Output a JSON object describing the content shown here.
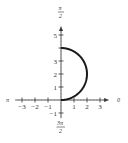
{
  "chart_data": {
    "type": "line",
    "coordinate_system": "polar",
    "title": "",
    "curve": {
      "name": "r = 4 sin θ",
      "theta_range": [
        0,
        1.5708
      ],
      "color": "#1a1a1a",
      "points_cartesian": [
        {
          "x": 0,
          "y": 0
        },
        {
          "x": 2,
          "y": 2
        },
        {
          "x": 0,
          "y": 4
        }
      ]
    },
    "x_ticks": [
      {
        "value": -3,
        "label": "−3"
      },
      {
        "value": -2,
        "label": "−2"
      },
      {
        "value": -1,
        "label": "−1"
      },
      {
        "value": 1,
        "label": "1"
      },
      {
        "value": 2,
        "label": "2"
      },
      {
        "value": 3,
        "label": "3"
      }
    ],
    "y_ticks": [
      {
        "value": -1,
        "label": "−1"
      },
      {
        "value": 1,
        "label": "1"
      },
      {
        "value": 2,
        "label": "2"
      },
      {
        "value": 3,
        "label": "3"
      },
      {
        "value": 4,
        "label": ""
      },
      {
        "value": 5,
        "label": "5"
      }
    ],
    "xlim": [
      -3.5,
      3.7
    ],
    "ylim": [
      -1.4,
      5.7
    ],
    "axis_labels": {
      "right": "0",
      "left": "π",
      "top_num": "π",
      "top_den": "2",
      "bottom_num": "3π",
      "bottom_den": "2"
    },
    "grid": false
  }
}
